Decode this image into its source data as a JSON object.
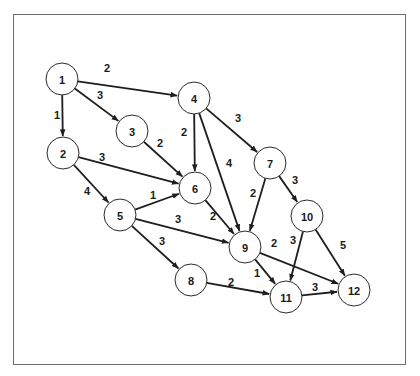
{
  "diagram": {
    "type": "directed-weighted-graph",
    "node_radius": 16,
    "colors": {
      "stroke": "#1e1e1e",
      "node_fill": "#ffffff",
      "frame": "#6e6e6e"
    },
    "nodes": [
      {
        "id": "1",
        "label": "1",
        "x": 62,
        "y": 79
      },
      {
        "id": "2",
        "label": "2",
        "x": 63,
        "y": 153
      },
      {
        "id": "3",
        "label": "3",
        "x": 132,
        "y": 131
      },
      {
        "id": "4",
        "label": "4",
        "x": 194,
        "y": 98
      },
      {
        "id": "5",
        "label": "5",
        "x": 120,
        "y": 215
      },
      {
        "id": "6",
        "label": "6",
        "x": 195,
        "y": 188
      },
      {
        "id": "7",
        "label": "7",
        "x": 270,
        "y": 163
      },
      {
        "id": "8",
        "label": "8",
        "x": 191,
        "y": 280
      },
      {
        "id": "9",
        "label": "9",
        "x": 245,
        "y": 247
      },
      {
        "id": "10",
        "label": "10",
        "x": 307,
        "y": 216
      },
      {
        "id": "11",
        "label": "11",
        "x": 286,
        "y": 297
      },
      {
        "id": "12",
        "label": "12",
        "x": 354,
        "y": 290
      }
    ],
    "edges": [
      {
        "from": "1",
        "to": "4",
        "weight": "2",
        "lx": 107,
        "ly": 68
      },
      {
        "from": "1",
        "to": "3",
        "weight": "3",
        "lx": 100,
        "ly": 95
      },
      {
        "from": "1",
        "to": "2",
        "weight": "1",
        "lx": 57,
        "ly": 115
      },
      {
        "from": "3",
        "to": "6",
        "weight": "2",
        "lx": 160,
        "ly": 143
      },
      {
        "from": "2",
        "to": "6",
        "weight": "3",
        "lx": 102,
        "ly": 157
      },
      {
        "from": "4",
        "to": "6",
        "weight": "2",
        "lx": 184,
        "ly": 132
      },
      {
        "from": "4",
        "to": "9",
        "weight": "4",
        "lx": 229,
        "ly": 163
      },
      {
        "from": "4",
        "to": "7",
        "weight": "3",
        "lx": 238,
        "ly": 118
      },
      {
        "from": "2",
        "to": "5",
        "weight": "4",
        "lx": 87,
        "ly": 191
      },
      {
        "from": "5",
        "to": "6",
        "weight": "1",
        "lx": 153,
        "ly": 195
      },
      {
        "from": "5",
        "to": "9",
        "weight": "3",
        "lx": 178,
        "ly": 219
      },
      {
        "from": "6",
        "to": "9",
        "weight": "2",
        "lx": 213,
        "ly": 216
      },
      {
        "from": "7",
        "to": "9",
        "weight": "2",
        "lx": 253,
        "ly": 193
      },
      {
        "from": "7",
        "to": "10",
        "weight": "3",
        "lx": 295,
        "ly": 180
      },
      {
        "from": "5",
        "to": "8",
        "weight": "3",
        "lx": 162,
        "ly": 241
      },
      {
        "from": "9",
        "to": "12",
        "weight": "2",
        "lx": 274,
        "ly": 243
      },
      {
        "from": "9",
        "to": "11",
        "weight": "1",
        "lx": 257,
        "ly": 273
      },
      {
        "from": "10",
        "to": "11",
        "weight": "3",
        "lx": 293,
        "ly": 240
      },
      {
        "from": "10",
        "to": "12",
        "weight": "5",
        "lx": 343,
        "ly": 245
      },
      {
        "from": "8",
        "to": "11",
        "weight": "2",
        "lx": 231,
        "ly": 282
      },
      {
        "from": "11",
        "to": "12",
        "weight": "3",
        "lx": 315,
        "ly": 287
      }
    ]
  }
}
